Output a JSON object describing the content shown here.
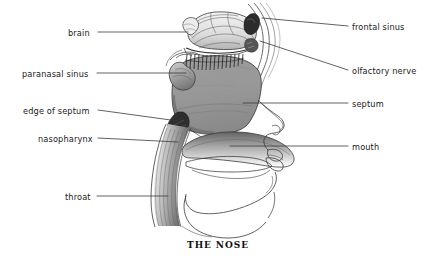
{
  "figure": {
    "caption": "THE NOSE",
    "background_color": "#ffffff",
    "line_color": "#3a3a3a",
    "text_color": "#1a1a1a",
    "cavity_fill_color": "#9a9a9a",
    "brain_fill_color": "#e8e8e8"
  },
  "labels_left": [
    {
      "id": "brain",
      "text": "brain",
      "x": 68,
      "y": 28,
      "line_x1": 98,
      "line_y1": 32,
      "line_x2": 188,
      "line_y2": 32
    },
    {
      "id": "paranasal-sinus",
      "text": "paranasal sinus",
      "x": 22,
      "y": 69,
      "line_x1": 97,
      "line_y1": 73,
      "line_x2": 186,
      "line_y2": 73
    },
    {
      "id": "edge-of-septum",
      "text": "edge of septum",
      "x": 23,
      "y": 106,
      "line_x1": 98,
      "line_y1": 110,
      "line_x2": 178,
      "line_y2": 121
    },
    {
      "id": "nasopharynx",
      "text": "nasopharynx",
      "x": 38,
      "y": 134,
      "line_x1": 98,
      "line_y1": 138,
      "line_x2": 178,
      "line_y2": 142
    },
    {
      "id": "throat",
      "text": "throat",
      "x": 65,
      "y": 192,
      "line_x1": 97,
      "line_y1": 196,
      "line_x2": 168,
      "line_y2": 196
    }
  ],
  "labels_right": [
    {
      "id": "frontal-sinus",
      "text": "frontal sinus",
      "x": 352,
      "y": 22,
      "line_x1": 348,
      "line_y1": 26,
      "line_x2": 262,
      "line_y2": 18
    },
    {
      "id": "olfactory-nerve",
      "text": "olfactory nerve",
      "x": 352,
      "y": 66,
      "line_x1": 348,
      "line_y1": 70,
      "line_x2": 260,
      "line_y2": 41
    },
    {
      "id": "septum",
      "text": "septum",
      "x": 352,
      "y": 99,
      "line_x1": 348,
      "line_y1": 103,
      "line_x2": 243,
      "line_y2": 103
    },
    {
      "id": "mouth",
      "text": "mouth",
      "x": 352,
      "y": 142,
      "line_x1": 348,
      "line_y1": 146,
      "line_x2": 230,
      "line_y2": 146
    }
  ]
}
